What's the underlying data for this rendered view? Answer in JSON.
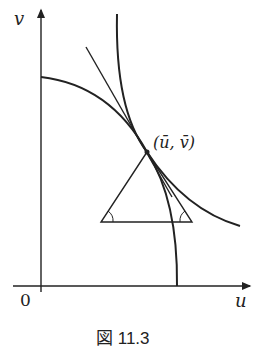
{
  "diagram": {
    "axis_x_label": "u",
    "axis_y_label": "v",
    "origin_label": "0",
    "point_label": "(ū, v̄)",
    "caption": "図 11.3",
    "stroke_color": "#222222"
  }
}
